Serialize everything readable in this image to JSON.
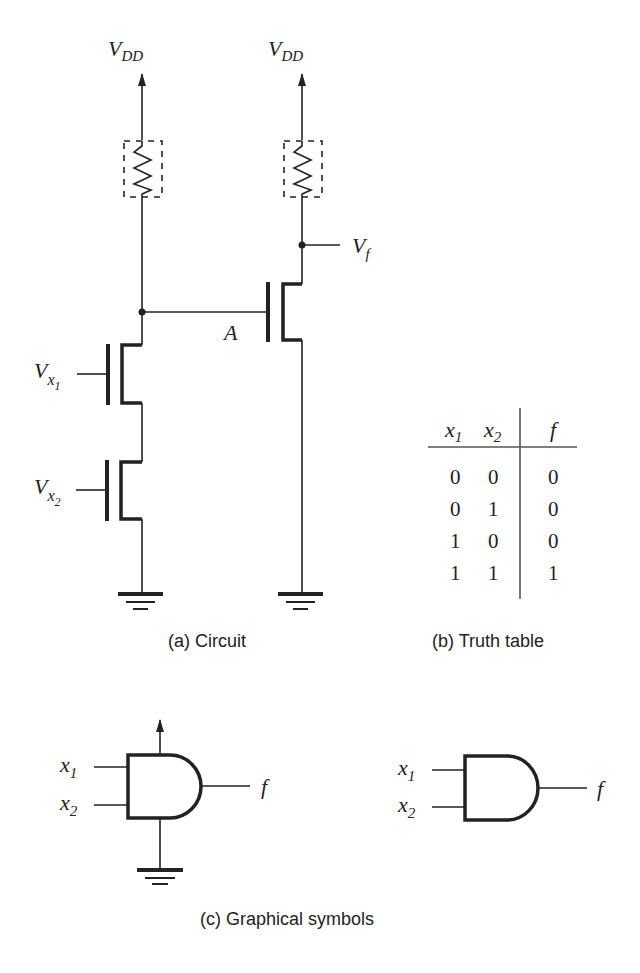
{
  "figure": {
    "circuit": {
      "caption": "(a) Circuit",
      "supply_label_main": "V",
      "supply_label_sub": "DD",
      "node_label": "A",
      "output_label_main": "V",
      "output_label_sub": "f",
      "input1_label_main": "V",
      "input1_label_sub": "x",
      "input1_label_subsub": "1",
      "input2_label_main": "V",
      "input2_label_sub": "x",
      "input2_label_subsub": "2"
    },
    "truth_table": {
      "caption": "(b) Truth table",
      "headers": [
        {
          "main": "x",
          "sub": "1"
        },
        {
          "main": "x",
          "sub": "2"
        },
        {
          "main": "f",
          "sub": ""
        }
      ],
      "rows": [
        [
          "0",
          "0",
          "0"
        ],
        [
          "0",
          "1",
          "0"
        ],
        [
          "1",
          "0",
          "0"
        ],
        [
          "1",
          "1",
          "1"
        ]
      ]
    },
    "symbols": {
      "caption": "(c) Graphical symbols",
      "input1_main": "x",
      "input1_sub": "1",
      "input2_main": "x",
      "input2_sub": "2",
      "output": "f"
    }
  }
}
